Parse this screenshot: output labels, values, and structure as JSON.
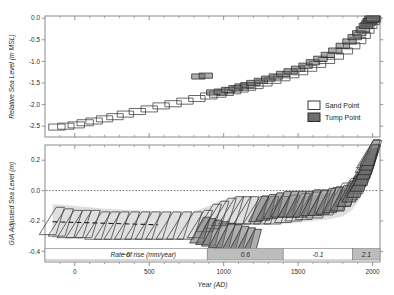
{
  "figure": {
    "background": "#ffffff",
    "frame_color": "#8a8a8a",
    "sand_point_color": "#ffffff",
    "sand_point_edge": "#3a3a3a",
    "tump_point_color": "#6e6e6e",
    "tump_point_edge": "#2a2a2a",
    "band_color": "#d9d9d9",
    "zero_line_color": "#555555",
    "rate_bar_fill_high": "#bdbdbd",
    "rate_bar_fill_low": "#ffffff",
    "rate_bar_edge": "#8a8a8a"
  },
  "legend": {
    "position": "bottom-right of upper panel",
    "entries": [
      {
        "label": "Sand Point",
        "swatch": "open-white-box"
      },
      {
        "label": "Tump Point",
        "swatch": "filled-gray-box"
      }
    ]
  },
  "chart_data": [
    {
      "panel": "upper",
      "type": "scatter",
      "title": "",
      "xlabel": "",
      "ylabel": "Relative Sea Level (m MSL)",
      "xlim": [
        -200,
        2050
      ],
      "ylim": [
        -2.75,
        0.05
      ],
      "xticks": [
        0,
        500,
        1000,
        1500,
        2000
      ],
      "xticklabels": [
        "",
        "",
        "",
        "",
        ""
      ],
      "yticks": [
        0.0,
        -0.5,
        -1.0,
        -1.5,
        -2.0,
        -2.5
      ],
      "yticklabels": [
        "0.0",
        "-0.5",
        "-1.0",
        "-1.5",
        "-2.0",
        "-2.5"
      ],
      "grid": false,
      "series": [
        {
          "name": "Sand Point",
          "marker": "error-box",
          "x": [
            -120,
            -60,
            10,
            70,
            130,
            200,
            270,
            340,
            420,
            500,
            580,
            660,
            740,
            820,
            900,
            960,
            1010,
            1060,
            1110,
            1160,
            1210,
            1270,
            1330,
            1390,
            1450,
            1510,
            1570,
            1630,
            1690,
            1750,
            1810,
            1860,
            1900,
            1930,
            1955,
            1975,
            1990,
            2000
          ],
          "y": [
            -2.52,
            -2.5,
            -2.47,
            -2.42,
            -2.38,
            -2.33,
            -2.28,
            -2.22,
            -2.16,
            -2.1,
            -2.03,
            -1.98,
            -1.92,
            -1.86,
            -1.8,
            -1.76,
            -1.72,
            -1.68,
            -1.64,
            -1.6,
            -1.56,
            -1.5,
            -1.44,
            -1.38,
            -1.31,
            -1.24,
            -1.16,
            -1.07,
            -0.98,
            -0.88,
            -0.76,
            -0.64,
            -0.52,
            -0.4,
            -0.28,
            -0.17,
            -0.08,
            -0.02
          ],
          "xerr": 55,
          "yerr": 0.07
        },
        {
          "name": "Tump Point",
          "marker": "error-box",
          "x": [
            830,
            880,
            930,
            980,
            1030,
            1080,
            1120,
            1160,
            1200,
            1250,
            1300,
            1350,
            1400,
            1450,
            1500,
            1550,
            1600,
            1650,
            1700,
            1750,
            1800,
            1845,
            1880,
            1910,
            1935,
            1955,
            1972,
            1985,
            1995,
            2002
          ],
          "y": [
            -1.35,
            -1.33,
            -1.72,
            -1.7,
            -1.66,
            -1.62,
            -1.58,
            -1.55,
            -1.5,
            -1.45,
            -1.4,
            -1.35,
            -1.29,
            -1.23,
            -1.17,
            -1.1,
            -1.02,
            -0.94,
            -0.85,
            -0.75,
            -0.64,
            -0.54,
            -0.44,
            -0.35,
            -0.26,
            -0.18,
            -0.12,
            -0.07,
            -0.04,
            -0.01
          ],
          "xerr": 45,
          "yerr": 0.06
        }
      ]
    },
    {
      "panel": "lower",
      "type": "scatter",
      "title": "",
      "xlabel": "Year (AD)",
      "ylabel": "GIA Adjusted Sea Level (m)",
      "xlim": [
        -200,
        2050
      ],
      "ylim": [
        -0.47,
        0.3
      ],
      "xticks": [
        0,
        500,
        1000,
        1500,
        2000
      ],
      "xticklabels": [
        "0",
        "500",
        "1000",
        "1500",
        "2000"
      ],
      "yticks": [
        0.2,
        0.0,
        -0.2,
        -0.4
      ],
      "yticklabels": [
        "0.2",
        "0.0",
        "-0.2",
        "-0.4"
      ],
      "grid": false,
      "reference_lines": [
        {
          "value": 0.0,
          "style": "dotted",
          "orientation": "horizontal"
        }
      ],
      "confidence_band": {
        "label": "95% credible interval",
        "x": [
          -150,
          0,
          200,
          400,
          600,
          800,
          900,
          1000,
          1100,
          1200,
          1300,
          1400,
          1500,
          1600,
          1700,
          1800,
          1860,
          1900,
          1940,
          1970,
          2000
        ],
        "upper": [
          -0.09,
          -0.1,
          -0.12,
          -0.13,
          -0.14,
          -0.14,
          -0.1,
          -0.06,
          -0.04,
          -0.04,
          -0.05,
          -0.05,
          -0.04,
          -0.03,
          -0.02,
          0.0,
          0.03,
          0.07,
          0.13,
          0.19,
          0.24
        ],
        "lower": [
          -0.31,
          -0.31,
          -0.31,
          -0.32,
          -0.32,
          -0.32,
          -0.28,
          -0.24,
          -0.22,
          -0.22,
          -0.22,
          -0.22,
          -0.21,
          -0.2,
          -0.19,
          -0.17,
          -0.13,
          -0.08,
          -0.01,
          0.07,
          0.14
        ]
      },
      "series": [
        {
          "name": "Sand Point",
          "marker": "error-box",
          "x": [
            -130,
            -70,
            -10,
            50,
            110,
            175,
            240,
            305,
            375,
            445,
            515,
            585,
            655,
            725,
            795,
            865,
            925,
            975,
            1025,
            1075,
            1125,
            1175,
            1240,
            1310,
            1380,
            1450,
            1520,
            1590,
            1660,
            1730,
            1795,
            1850,
            1895,
            1930,
            1958,
            1978,
            1992,
            2001
          ],
          "y": [
            -0.2,
            -0.21,
            -0.22,
            -0.22,
            -0.22,
            -0.23,
            -0.23,
            -0.23,
            -0.23,
            -0.23,
            -0.23,
            -0.23,
            -0.23,
            -0.23,
            -0.23,
            -0.22,
            -0.18,
            -0.16,
            -0.14,
            -0.13,
            -0.13,
            -0.13,
            -0.13,
            -0.13,
            -0.13,
            -0.12,
            -0.11,
            -0.1,
            -0.09,
            -0.07,
            -0.04,
            -0.01,
            0.03,
            0.07,
            0.12,
            0.17,
            0.21,
            0.24
          ],
          "xerr": 52,
          "yerr": 0.09
        },
        {
          "name": "Tump Point",
          "marker": "error-box",
          "x": [
            860,
            900,
            940,
            985,
            1030,
            1075,
            1120,
            1165,
            1205,
            1255,
            1305,
            1355,
            1405,
            1455,
            1505,
            1555,
            1605,
            1655,
            1705,
            1755,
            1805,
            1848,
            1882,
            1912,
            1938,
            1958,
            1974,
            1987,
            1996,
            2003
          ],
          "y": [
            -0.26,
            -0.27,
            -0.28,
            -0.29,
            -0.3,
            -0.31,
            -0.32,
            -0.33,
            -0.34,
            -0.12,
            -0.11,
            -0.1,
            -0.09,
            -0.09,
            -0.09,
            -0.09,
            -0.08,
            -0.08,
            -0.07,
            -0.06,
            -0.05,
            -0.02,
            0.01,
            0.04,
            0.08,
            0.12,
            0.16,
            0.19,
            0.22,
            0.25
          ],
          "xerr": 42,
          "yerr": 0.085
        }
      ],
      "rate_bar": {
        "title": "Rate of rise (mm/year)",
        "segments": [
          {
            "label": "~0",
            "x_start": -200,
            "x_end": 890,
            "shade": "light"
          },
          {
            "label": "0.6",
            "x_start": 890,
            "x_end": 1400,
            "shade": "dark"
          },
          {
            "label": "-0.1",
            "x_start": 1400,
            "x_end": 1865,
            "shade": "light"
          },
          {
            "label": "2.1",
            "x_start": 1865,
            "x_end": 2050,
            "shade": "dark"
          }
        ]
      }
    }
  ]
}
